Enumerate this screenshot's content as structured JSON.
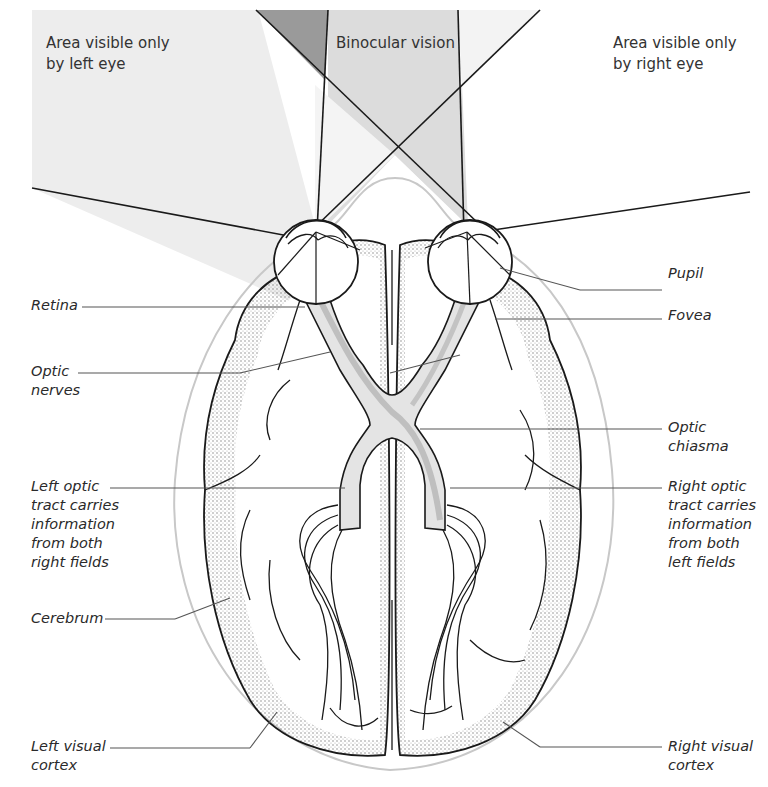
{
  "colors": {
    "background": "#ffffff",
    "left_only_field": "#ededed",
    "binocular_field": "#dcdcdc",
    "overlap_dark": "#9a9a9a",
    "right_top_light": "#f3f3f3",
    "stroke": "#1a1a1a",
    "leader": "#555555",
    "head_outline": "#c8c8c8",
    "nerve_fill": "#e4e4e4",
    "nerve_shade": "#b5b5b5",
    "stipple": "#7a7a7a"
  },
  "fields": {
    "left_only": "Area visible only\nby left eye",
    "binocular": "Binocular vision",
    "right_only": "Area visible only\nby right eye"
  },
  "labels": {
    "retina": "Retina",
    "optic_nerves": "Optic\nnerves",
    "left_optic_tract": "Left optic\ntract carries\ninformation\nfrom both\nright fields",
    "cerebrum": "Cerebrum",
    "left_visual_cortex": "Left visual\ncortex",
    "pupil": "Pupil",
    "fovea": "Fovea",
    "optic_chiasma": "Optic\nchiasma",
    "right_optic_tract": "Right optic\ntract carries\ninformation\nfrom both\nleft fields",
    "right_visual_cortex": "Right visual\ncortex"
  }
}
